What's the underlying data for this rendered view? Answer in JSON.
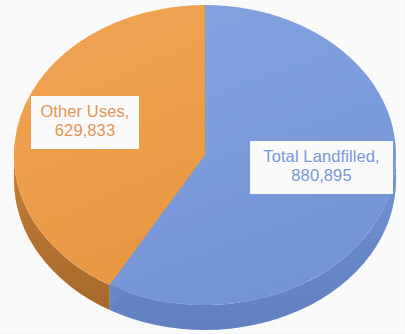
{
  "chart_data": {
    "type": "pie",
    "title": "",
    "subtitle": "",
    "xlabel": "",
    "ylabel": "",
    "legend_position": "none",
    "grid": false,
    "three_d": true,
    "labels_inside": true,
    "categories": [
      "Total Landfilled",
      "Other Uses"
    ],
    "values": [
      880895,
      629833
    ],
    "total": 1510728,
    "slices": [
      {
        "name": "Total Landfilled",
        "value": 880895,
        "value_text": "880,895",
        "label_text": "Total Landfilled,",
        "percent": 58.3,
        "color": "#7E9FE0",
        "side_color": "#6D8ECF",
        "text_color": "#7B9BDC",
        "start_angle_deg": 0,
        "end_angle_deg": 209.9
      },
      {
        "name": "Other Uses",
        "value": 629833,
        "value_text": "629,833",
        "label_text": "Other Uses,",
        "percent": 41.7,
        "color": "#F3A24D",
        "side_color": "#C98138",
        "text_color": "#E89A56",
        "start_angle_deg": 209.9,
        "end_angle_deg": 360
      }
    ]
  },
  "labels": {
    "other_uses": {
      "line1": "Other Uses,",
      "line2": "629,833"
    },
    "total_landfilled": {
      "line1": "Total Landfilled,",
      "line2": "880,895"
    }
  },
  "colors": {
    "background": "#FFFFFF",
    "slice_blue": "#7E9FE0",
    "slice_blue_side": "#6D8ECF",
    "slice_orange": "#F3A24D",
    "slice_orange_side": "#C98138",
    "label_box": "#FFFFFF"
  }
}
